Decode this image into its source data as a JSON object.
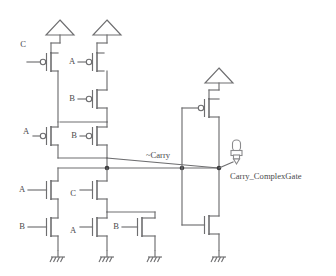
{
  "diagram": {
    "colors": {
      "wire": "#6e6e70",
      "junction": "#3a3a3c",
      "text": "#4a4a4c",
      "background": "#ffffff"
    },
    "nets": {
      "internal_output": "~Carry",
      "final_output": "Carry_ComplexGate"
    },
    "pmos_labels": {
      "p_c_top": "C",
      "p_a_top": "A",
      "p_b_mid": "B",
      "p_a_left": "A",
      "p_b_right": "B"
    },
    "nmos_labels": {
      "n_a_upper_left": "A",
      "n_b_lower_left": "B",
      "n_c_upper_mid": "C",
      "n_a_lower_mid": "A",
      "n_b_right": "B"
    },
    "supply_symbols": [
      {
        "name": "vdd-left",
        "label": ""
      },
      {
        "name": "vdd-mid",
        "label": ""
      },
      {
        "name": "vdd-inverter",
        "label": ""
      }
    ],
    "ground_symbols": [
      {
        "name": "gnd-1",
        "label": ""
      },
      {
        "name": "gnd-2",
        "label": ""
      },
      {
        "name": "gnd-3",
        "label": ""
      },
      {
        "name": "gnd-4",
        "label": ""
      }
    ],
    "probe": {
      "name": "output-probe",
      "label": "Carry_ComplexGate"
    }
  }
}
